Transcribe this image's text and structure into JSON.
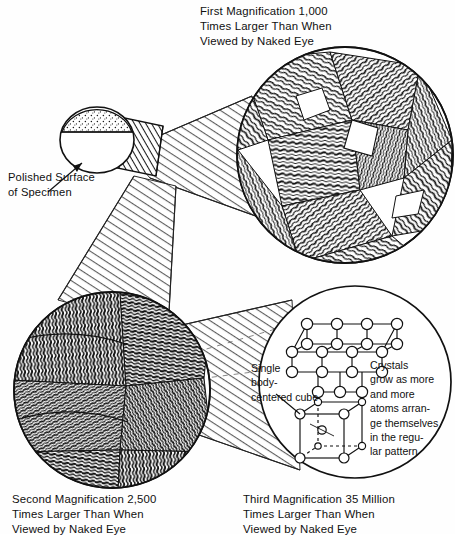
{
  "figure": {
    "background_color": "#fefefe",
    "ink_color": "#101010"
  },
  "captions": {
    "first": "First Magnification 1,000\nTimes Larger Than When\nViewed by Naked Eye",
    "second": "Second Magnification 2,500\nTimes Larger Than When\nViewed by Naked Eye",
    "third": "Third Magnification 35 Million\nTimes Larger Than When\nViewed by Naked Eye"
  },
  "labels": {
    "polished_surface": "Polished Surface\nof Specimen",
    "single_cube": "Single\nbody-\ncentered cube",
    "crystals_grow": "Crystals\ngrow as more\nand more\natoms arran-\nge themselves\nin the regu-\nlar pattern"
  },
  "magnifications": [
    {
      "order": "first",
      "factor": "1,000",
      "label": "First Magnification 1,000"
    },
    {
      "order": "second",
      "factor": "2,500",
      "label": "Second Magnification 2,500"
    },
    {
      "order": "third",
      "factor": "35 Million",
      "label": "Third Magnification 35 Million"
    }
  ],
  "elements": {
    "specimen": "cylindrical-specimen",
    "polished_face": "speckled-polished-face",
    "circle_first": "grain-structure-circle",
    "circle_second": "fine-grain-circle",
    "circle_third": "crystal-lattice-circle",
    "lattice": "body-centered-cubic-lattice",
    "unit_cell": "body-centered-cube"
  }
}
